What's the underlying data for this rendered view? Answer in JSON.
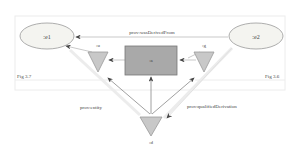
{
  "figure": {
    "left_caption": "Fig 3.7",
    "right_caption": "Fig 3.6"
  },
  "nodes": {
    "e1": ":e1",
    "e2": ":e2",
    "activity": ":a",
    "usage": ":u",
    "generation": ":g",
    "derivation": ":d"
  },
  "edges": {
    "was_derived_from": "prov:wasDerivedFrom",
    "entity": "prov:entity",
    "qualified_derivation": "prov:qualifiedDerivation"
  },
  "colors": {
    "entity_fill": "#f2f2ee",
    "activity_fill": "#a9a9a9",
    "influence_fill": "#c8c8c8",
    "panel_border": "#e4e4e4",
    "arrow": "#555555"
  }
}
